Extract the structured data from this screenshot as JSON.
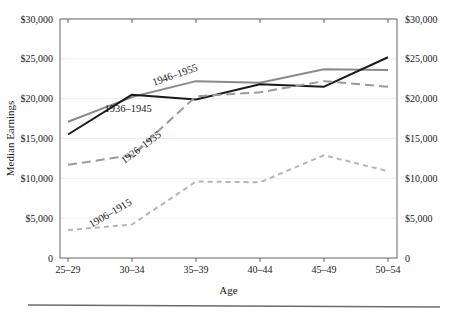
{
  "chart_data": {
    "type": "line",
    "title": "",
    "subtitle": "",
    "xlabel": "Age",
    "ylabel": "Median Earnings",
    "ylabel_right": "Median Earnings",
    "categories": [
      "25–29",
      "30–34",
      "35–39",
      "40–44",
      "45–49",
      "50–54"
    ],
    "ylim": [
      0,
      30000
    ],
    "yticks": [
      0,
      5000,
      10000,
      15000,
      20000,
      25000,
      30000
    ],
    "ytick_labels": [
      "0",
      "$5,000",
      "$10,000",
      "$15,000",
      "$20,000",
      "$25,000",
      "$30,000"
    ],
    "ytick_labels_right": [
      "0",
      "$5,000",
      "$10,000",
      "$15,000",
      "$20,000",
      "$25,000",
      "$30,000"
    ],
    "grid": true,
    "grid_axis": "y",
    "legend": "inline-annotations",
    "legend_position": "inline",
    "series": [
      {
        "name": "1946–1955",
        "values": [
          17100,
          20200,
          22200,
          22000,
          23700,
          23600
        ],
        "color": "#8a8a8a",
        "style": "solid",
        "width": 2.0,
        "label_x": 176,
        "label_y": 78,
        "label_rotate": -19
      },
      {
        "name": "1936–1945",
        "values": [
          15500,
          20500,
          19900,
          21800,
          21500,
          25200
        ],
        "color": "#1a1a1a",
        "style": "solid",
        "width": 2.0,
        "label_x": 128,
        "label_y": 112,
        "label_rotate": 0
      },
      {
        "name": "1926–1935",
        "values": [
          11700,
          12900,
          20300,
          20800,
          22200,
          21500
        ],
        "color": "#9a9a9a",
        "style": "long-dash",
        "width": 2.0,
        "label_x": 143,
        "label_y": 150,
        "label_rotate": -37
      },
      {
        "name": "1906–1915",
        "values": [
          3500,
          4200,
          9600,
          9500,
          12900,
          10900
        ],
        "color": "#b6b6b6",
        "style": "short-dash",
        "width": 2.0,
        "label_x": 112,
        "label_y": 216,
        "label_rotate": -30
      }
    ]
  },
  "colors": {
    "axis": "#555555",
    "grid": "#efefef",
    "text": "#1a1a1a",
    "rule": "#6b6b6b",
    "background": "#ffffff"
  },
  "footer": {
    "rule_visible": true
  }
}
